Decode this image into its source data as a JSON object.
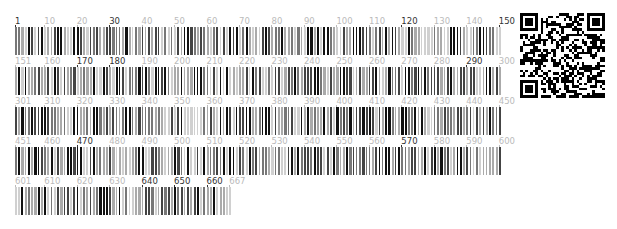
{
  "sequence": {
    "length": 667,
    "per_row": 150,
    "rows": [
      {
        "start": 1,
        "end": 150,
        "labels": [
          {
            "pos": 1,
            "text": "1",
            "dark": true
          },
          {
            "pos": 10,
            "text": "10",
            "dark": false
          },
          {
            "pos": 20,
            "text": "20",
            "dark": false
          },
          {
            "pos": 30,
            "text": "30",
            "dark": true
          },
          {
            "pos": 40,
            "text": "40",
            "dark": false
          },
          {
            "pos": 50,
            "text": "50",
            "dark": false
          },
          {
            "pos": 60,
            "text": "60",
            "dark": false
          },
          {
            "pos": 70,
            "text": "70",
            "dark": false
          },
          {
            "pos": 80,
            "text": "80",
            "dark": false
          },
          {
            "pos": 90,
            "text": "90",
            "dark": false
          },
          {
            "pos": 100,
            "text": "100",
            "dark": false
          },
          {
            "pos": 110,
            "text": "110",
            "dark": false
          },
          {
            "pos": 120,
            "text": "120",
            "dark": true
          },
          {
            "pos": 130,
            "text": "130",
            "dark": false
          },
          {
            "pos": 140,
            "text": "140",
            "dark": false
          },
          {
            "pos": 150,
            "text": "150",
            "dark": true
          }
        ]
      },
      {
        "start": 151,
        "end": 300,
        "labels": [
          {
            "pos": 151,
            "text": "151",
            "dark": false
          },
          {
            "pos": 160,
            "text": "160",
            "dark": false
          },
          {
            "pos": 170,
            "text": "170",
            "dark": true
          },
          {
            "pos": 180,
            "text": "180",
            "dark": true
          },
          {
            "pos": 190,
            "text": "190",
            "dark": false
          },
          {
            "pos": 200,
            "text": "200",
            "dark": false
          },
          {
            "pos": 210,
            "text": "210",
            "dark": false
          },
          {
            "pos": 220,
            "text": "220",
            "dark": false
          },
          {
            "pos": 230,
            "text": "230",
            "dark": false
          },
          {
            "pos": 240,
            "text": "240",
            "dark": false
          },
          {
            "pos": 250,
            "text": "250",
            "dark": false
          },
          {
            "pos": 260,
            "text": "260",
            "dark": false
          },
          {
            "pos": 270,
            "text": "270",
            "dark": false
          },
          {
            "pos": 280,
            "text": "280",
            "dark": false
          },
          {
            "pos": 290,
            "text": "290",
            "dark": true
          },
          {
            "pos": 300,
            "text": "300",
            "dark": false
          }
        ]
      },
      {
        "start": 301,
        "end": 450,
        "labels": [
          {
            "pos": 301,
            "text": "301",
            "dark": false
          },
          {
            "pos": 310,
            "text": "310",
            "dark": false
          },
          {
            "pos": 320,
            "text": "320",
            "dark": false
          },
          {
            "pos": 330,
            "text": "330",
            "dark": false
          },
          {
            "pos": 340,
            "text": "340",
            "dark": false
          },
          {
            "pos": 350,
            "text": "350",
            "dark": false
          },
          {
            "pos": 360,
            "text": "360",
            "dark": false
          },
          {
            "pos": 370,
            "text": "370",
            "dark": false
          },
          {
            "pos": 380,
            "text": "380",
            "dark": false
          },
          {
            "pos": 390,
            "text": "390",
            "dark": false
          },
          {
            "pos": 400,
            "text": "400",
            "dark": false
          },
          {
            "pos": 410,
            "text": "410",
            "dark": false
          },
          {
            "pos": 420,
            "text": "420",
            "dark": false
          },
          {
            "pos": 430,
            "text": "430",
            "dark": false
          },
          {
            "pos": 440,
            "text": "440",
            "dark": false
          },
          {
            "pos": 450,
            "text": "450",
            "dark": false
          }
        ]
      },
      {
        "start": 451,
        "end": 600,
        "labels": [
          {
            "pos": 451,
            "text": "451",
            "dark": false
          },
          {
            "pos": 460,
            "text": "460",
            "dark": false
          },
          {
            "pos": 470,
            "text": "470",
            "dark": true
          },
          {
            "pos": 480,
            "text": "480",
            "dark": false
          },
          {
            "pos": 490,
            "text": "490",
            "dark": false
          },
          {
            "pos": 500,
            "text": "500",
            "dark": false
          },
          {
            "pos": 510,
            "text": "510",
            "dark": false
          },
          {
            "pos": 520,
            "text": "520",
            "dark": false
          },
          {
            "pos": 530,
            "text": "530",
            "dark": false
          },
          {
            "pos": 540,
            "text": "540",
            "dark": false
          },
          {
            "pos": 550,
            "text": "550",
            "dark": false
          },
          {
            "pos": 560,
            "text": "560",
            "dark": false
          },
          {
            "pos": 570,
            "text": "570",
            "dark": true
          },
          {
            "pos": 580,
            "text": "580",
            "dark": false
          },
          {
            "pos": 590,
            "text": "590",
            "dark": false
          },
          {
            "pos": 600,
            "text": "600",
            "dark": false
          }
        ]
      },
      {
        "start": 601,
        "end": 667,
        "labels": [
          {
            "pos": 601,
            "text": "601",
            "dark": false
          },
          {
            "pos": 610,
            "text": "610",
            "dark": false
          },
          {
            "pos": 620,
            "text": "620",
            "dark": false
          },
          {
            "pos": 630,
            "text": "630",
            "dark": false
          },
          {
            "pos": 640,
            "text": "640",
            "dark": true
          },
          {
            "pos": 650,
            "text": "650",
            "dark": true
          },
          {
            "pos": 660,
            "text": "660",
            "dark": true
          },
          {
            "pos": 667,
            "text": "667",
            "dark": false
          }
        ]
      }
    ]
  },
  "colors": {
    "label_dark": "#333333",
    "label_light": "#bbbbbb",
    "bar_levels": [
      "#111111",
      "#444444",
      "#777777",
      "#aaaaaa",
      "#d0d0d0"
    ]
  },
  "qr": {
    "modules": 33
  }
}
